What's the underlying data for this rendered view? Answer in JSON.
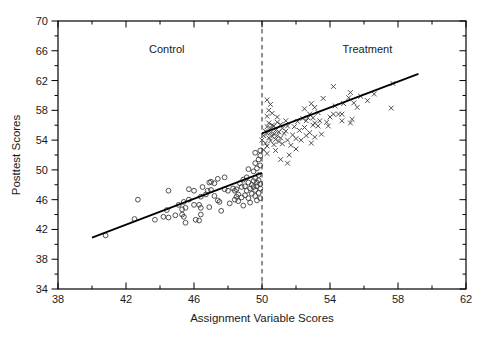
{
  "figure": {
    "width": 493,
    "height": 343,
    "background_color": "#ffffff",
    "axis_color": "#000000",
    "marker_color": "#3d3d3d",
    "fit_line_color": "#000000",
    "cutoff_line_color": "#4a4a4a",
    "text_color": "#1a1a1a"
  },
  "chart_data": {
    "type": "scatter",
    "title": "",
    "xlabel": "Assignment Variable Scores",
    "ylabel": "Posttest Scores",
    "xlim": [
      38,
      62
    ],
    "ylim": [
      34,
      70
    ],
    "grid": false,
    "legend": "none",
    "x_major_ticks": [
      38,
      42,
      46,
      50,
      54,
      58,
      62
    ],
    "x_minor_ticks": [
      40,
      44,
      48,
      52,
      56,
      60
    ],
    "y_major_ticks": [
      34,
      38,
      42,
      46,
      50,
      54,
      58,
      62,
      66,
      70
    ],
    "y_minor_ticks": [
      36,
      40,
      44,
      48,
      52,
      56,
      60,
      64,
      68
    ],
    "plot_area": {
      "left": 58,
      "top": 21,
      "width": 408,
      "height": 268
    },
    "annotations": [
      {
        "text": "Control",
        "x": 44.4,
        "y": 66.3
      },
      {
        "text": "Treatment",
        "x": 56.2,
        "y": 66.3
      }
    ],
    "cutoff_line": {
      "x": 50,
      "style": "dashed"
    },
    "fit_lines": [
      {
        "name": "control-fit",
        "x1": 40.0,
        "y1": 40.9,
        "x2": 50.0,
        "y2": 49.6
      },
      {
        "name": "treatment-fit",
        "x1": 50.0,
        "y1": 54.9,
        "x2": 59.2,
        "y2": 62.9
      }
    ],
    "series": [
      {
        "name": "Control",
        "marker": "circle",
        "points": [
          [
            40.8,
            41.2
          ],
          [
            42.5,
            43.4
          ],
          [
            42.7,
            46.0
          ],
          [
            43.7,
            43.3
          ],
          [
            44.2,
            43.7
          ],
          [
            44.5,
            43.6
          ],
          [
            44.9,
            43.9
          ],
          [
            44.5,
            47.2
          ],
          [
            44.4,
            44.6
          ],
          [
            45.1,
            45.3
          ],
          [
            45.4,
            45.7
          ],
          [
            45.7,
            46.0
          ],
          [
            45.3,
            44.7
          ],
          [
            45.3,
            44.0
          ],
          [
            45.4,
            43.7
          ],
          [
            45.5,
            42.9
          ],
          [
            45.5,
            44.9
          ],
          [
            45.7,
            47.4
          ],
          [
            46.0,
            47.2
          ],
          [
            46.0,
            45.3
          ],
          [
            46.1,
            43.3
          ],
          [
            46.3,
            43.2
          ],
          [
            46.3,
            45.3
          ],
          [
            46.4,
            44.9
          ],
          [
            46.4,
            44.0
          ],
          [
            46.4,
            46.4
          ],
          [
            46.5,
            47.7
          ],
          [
            46.7,
            46.7
          ],
          [
            46.8,
            47.2
          ],
          [
            46.9,
            48.3
          ],
          [
            46.9,
            45.0
          ],
          [
            47.0,
            48.4
          ],
          [
            47.0,
            47.3
          ],
          [
            47.2,
            48.2
          ],
          [
            47.2,
            46.5
          ],
          [
            47.4,
            48.8
          ],
          [
            47.4,
            45.9
          ],
          [
            47.5,
            45.7
          ],
          [
            47.6,
            44.5
          ],
          [
            47.8,
            49.0
          ],
          [
            47.8,
            47.4
          ],
          [
            48.0,
            47.2
          ],
          [
            48.1,
            45.5
          ],
          [
            48.3,
            47.5
          ],
          [
            48.4,
            47.2
          ],
          [
            48.4,
            46.0
          ],
          [
            48.5,
            47.4
          ],
          [
            48.5,
            46.4
          ],
          [
            48.6,
            46.7
          ],
          [
            48.6,
            45.8
          ],
          [
            48.7,
            48.2
          ],
          [
            48.8,
            46.3
          ],
          [
            48.8,
            47.7
          ],
          [
            48.9,
            48.7
          ],
          [
            48.9,
            45.2
          ],
          [
            49.0,
            47.8
          ],
          [
            49.0,
            46.6
          ],
          [
            49.1,
            49.0
          ],
          [
            49.1,
            47.2
          ],
          [
            49.2,
            48.3
          ],
          [
            49.2,
            46.2
          ],
          [
            49.2,
            50.1
          ],
          [
            49.3,
            47.5
          ],
          [
            49.3,
            45.6
          ],
          [
            49.4,
            48.0
          ],
          [
            49.4,
            46.8
          ],
          [
            49.5,
            48.5
          ],
          [
            49.5,
            47.7
          ],
          [
            49.5,
            49.8
          ],
          [
            49.6,
            48.9
          ],
          [
            49.6,
            47.3
          ],
          [
            49.6,
            46.5
          ],
          [
            49.6,
            50.9
          ],
          [
            49.6,
            52.3
          ],
          [
            49.7,
            48.3
          ],
          [
            49.7,
            47.8
          ],
          [
            49.7,
            45.9
          ],
          [
            49.7,
            50.2
          ],
          [
            49.8,
            48.6
          ],
          [
            49.8,
            46.9
          ],
          [
            49.8,
            49.3
          ],
          [
            49.8,
            51.4
          ],
          [
            49.9,
            48.1
          ],
          [
            49.9,
            47.5
          ],
          [
            49.9,
            46.2
          ],
          [
            49.9,
            50.6
          ],
          [
            49.9,
            51.9
          ],
          [
            49.9,
            52.6
          ]
        ]
      },
      {
        "name": "Treatment",
        "marker": "x",
        "points": [
          [
            50.0,
            54.0
          ],
          [
            50.1,
            54.6
          ],
          [
            50.1,
            52.7
          ],
          [
            50.2,
            55.2
          ],
          [
            50.2,
            53.6
          ],
          [
            50.3,
            54.9
          ],
          [
            50.3,
            55.8
          ],
          [
            50.3,
            53.2
          ],
          [
            50.3,
            57.2
          ],
          [
            50.3,
            59.4
          ],
          [
            50.3,
            52.2
          ],
          [
            50.4,
            54.3
          ],
          [
            50.4,
            56.3
          ],
          [
            50.4,
            58.0
          ],
          [
            50.5,
            55.0
          ],
          [
            50.5,
            53.9
          ],
          [
            50.5,
            55.6
          ],
          [
            50.5,
            58.8
          ],
          [
            50.6,
            54.5
          ],
          [
            50.6,
            56.0
          ],
          [
            50.6,
            57.6
          ],
          [
            50.7,
            53.4
          ],
          [
            50.7,
            54.8
          ],
          [
            50.7,
            55.9
          ],
          [
            50.8,
            54.1
          ],
          [
            50.8,
            55.3
          ],
          [
            50.8,
            52.6
          ],
          [
            50.9,
            56.4
          ],
          [
            50.9,
            54.6
          ],
          [
            50.9,
            57.1
          ],
          [
            51.0,
            53.8
          ],
          [
            51.0,
            55.1
          ],
          [
            51.1,
            56.1
          ],
          [
            51.1,
            54.3
          ],
          [
            51.1,
            51.4
          ],
          [
            51.2,
            55.6
          ],
          [
            51.2,
            53.5
          ],
          [
            51.3,
            54.9
          ],
          [
            51.4,
            56.6
          ],
          [
            51.4,
            55.2
          ],
          [
            51.5,
            54.0
          ],
          [
            51.5,
            55.9
          ],
          [
            51.5,
            50.9
          ],
          [
            51.6,
            52.0
          ],
          [
            51.7,
            53.3
          ],
          [
            51.8,
            54.7
          ],
          [
            51.9,
            55.8
          ],
          [
            52.0,
            54.2
          ],
          [
            52.0,
            52.8
          ],
          [
            52.1,
            56.5
          ],
          [
            52.2,
            55.3
          ],
          [
            52.3,
            54.0
          ],
          [
            52.4,
            56.9
          ],
          [
            52.5,
            55.7
          ],
          [
            52.5,
            58.2
          ],
          [
            52.6,
            54.6
          ],
          [
            52.6,
            56.6
          ],
          [
            52.7,
            57.0
          ],
          [
            52.8,
            55.0
          ],
          [
            52.8,
            57.5
          ],
          [
            52.9,
            53.6
          ],
          [
            52.9,
            58.9
          ],
          [
            53.0,
            56.0
          ],
          [
            53.0,
            57.0
          ],
          [
            53.1,
            54.4
          ],
          [
            53.1,
            56.3
          ],
          [
            53.1,
            58.4
          ],
          [
            53.3,
            55.9
          ],
          [
            53.3,
            57.7
          ],
          [
            53.4,
            56.6
          ],
          [
            53.5,
            54.8
          ],
          [
            53.6,
            59.6
          ],
          [
            53.8,
            56.4
          ],
          [
            53.9,
            55.9
          ],
          [
            54.0,
            57.1
          ],
          [
            54.2,
            61.2
          ],
          [
            54.2,
            57.5
          ],
          [
            54.3,
            58.6
          ],
          [
            54.5,
            57.5
          ],
          [
            54.7,
            57.5
          ],
          [
            54.7,
            56.6
          ],
          [
            54.8,
            58.9
          ],
          [
            55.1,
            59.7
          ],
          [
            55.2,
            60.4
          ],
          [
            55.2,
            56.3
          ],
          [
            55.3,
            56.8
          ],
          [
            55.4,
            59.0
          ],
          [
            55.6,
            58.4
          ],
          [
            55.8,
            59.9
          ],
          [
            56.2,
            59.3
          ],
          [
            56.6,
            60.2
          ],
          [
            57.6,
            58.3
          ],
          [
            57.7,
            61.6
          ]
        ]
      }
    ]
  }
}
